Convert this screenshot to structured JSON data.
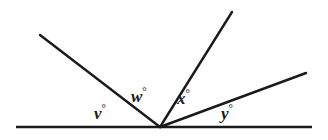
{
  "figure": {
    "type": "geometry-diagram",
    "background_color": "#ffffff",
    "stroke_color": "#1a1a1a",
    "labels": [
      {
        "id": "v",
        "variable": "v",
        "degree_symbol": "°",
        "text": "v"
      },
      {
        "id": "w",
        "variable": "w",
        "degree_symbol": "°",
        "text": "w"
      },
      {
        "id": "x",
        "variable": "x",
        "degree_symbol": "°",
        "text": "x"
      },
      {
        "id": "y",
        "variable": "y",
        "degree_symbol": "°",
        "text": "y"
      }
    ],
    "geometry": {
      "vertex": {
        "x": 160,
        "y": 127
      },
      "baseline": {
        "x1": 16,
        "y1": 127,
        "x2": 312,
        "y2": 127
      },
      "rays": [
        {
          "name": "ray-upper-left",
          "x1": 160,
          "y1": 127,
          "x2": 40,
          "y2": 35
        },
        {
          "name": "ray-steep-right",
          "x1": 160,
          "y1": 127,
          "x2": 232,
          "y2": 12
        },
        {
          "name": "ray-shallow-right",
          "x1": 160,
          "y1": 127,
          "x2": 306,
          "y2": 73
        }
      ]
    }
  }
}
